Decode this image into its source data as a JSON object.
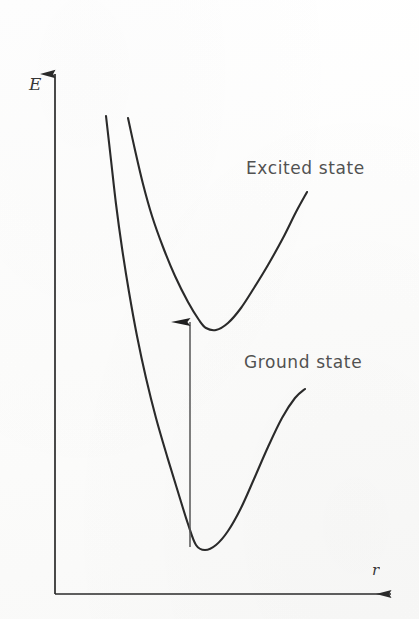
{
  "figure": {
    "type": "potential-energy-diagram",
    "background_color": "#fdfdfc",
    "ink_color": "#2a2a2a"
  },
  "axes": {
    "y": {
      "label": "E",
      "name": "energy-axis",
      "arrow": "up",
      "x_px": 55,
      "top_px": 60,
      "bottom_px": 594
    },
    "x": {
      "label": "r",
      "name": "internuclear-distance-axis",
      "arrow": "right",
      "y_px": 594,
      "left_px": 55,
      "right_px": 406
    }
  },
  "labels": {
    "excited_state": "Excited state",
    "ground_state": "Ground state"
  },
  "transition": {
    "name": "vertical-transition-arrow",
    "x_px": 190,
    "from_y_px": 547,
    "to_y_px": 322,
    "direction": "up"
  },
  "chart_data": {
    "type": "line",
    "title": "",
    "xlabel": "r",
    "ylabel": "E",
    "grid": false,
    "legend": "inline-annotations",
    "xlim": [
      55,
      419
    ],
    "ylim": [
      619,
      0
    ],
    "annotations": [
      {
        "text": "Excited state",
        "x": 246,
        "y": 172
      },
      {
        "text": "Ground state",
        "x": 244,
        "y": 366
      }
    ],
    "series": [
      {
        "name": "Excited state",
        "minimum": {
          "x": 206,
          "y": 328
        },
        "points": [
          [
            128,
            118
          ],
          [
            135,
            150
          ],
          [
            143,
            184
          ],
          [
            152,
            216
          ],
          [
            163,
            247
          ],
          [
            175,
            276
          ],
          [
            188,
            302
          ],
          [
            199,
            320
          ],
          [
            206,
            328
          ],
          [
            216,
            330
          ],
          [
            228,
            323
          ],
          [
            241,
            308
          ],
          [
            254,
            288
          ],
          [
            268,
            265
          ],
          [
            283,
            238
          ],
          [
            296,
            212
          ],
          [
            307,
            192
          ]
        ]
      },
      {
        "name": "Ground state",
        "minimum": {
          "x": 195,
          "y": 547
        },
        "points": [
          [
            106,
            116
          ],
          [
            111,
            160
          ],
          [
            116,
            204
          ],
          [
            122,
            248
          ],
          [
            129,
            292
          ],
          [
            137,
            336
          ],
          [
            146,
            378
          ],
          [
            156,
            418
          ],
          [
            167,
            456
          ],
          [
            178,
            492
          ],
          [
            188,
            524
          ],
          [
            196,
            545
          ],
          [
            205,
            550
          ],
          [
            216,
            545
          ],
          [
            228,
            531
          ],
          [
            241,
            508
          ],
          [
            254,
            479
          ],
          [
            268,
            447
          ],
          [
            282,
            418
          ],
          [
            295,
            398
          ],
          [
            305,
            389
          ]
        ]
      }
    ]
  }
}
